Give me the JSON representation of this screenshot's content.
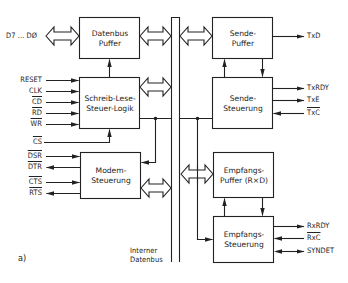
{
  "figure_label": "a)",
  "bus": {
    "label_line1": "Interner",
    "label_line2": "Datenbus"
  },
  "blocks": {
    "datenbus_puffer": {
      "line1": "Datenbus",
      "line2": "Puffer"
    },
    "schreib_lese": {
      "line1": "Schreib-Lese-",
      "line2": "Steuer-Logik"
    },
    "modem": {
      "line1": "Modem-",
      "line2": "Steuerung"
    },
    "sende_puffer": {
      "line1": "Sende-",
      "line2": "Puffer"
    },
    "sende_steuerung": {
      "line1": "Sende-",
      "line2": "Steuerung"
    },
    "empfangs_puffer": {
      "line1": "Empfangs-",
      "line2": "Puffer (R×D)"
    },
    "empfangs_steuerung": {
      "line1": "Empfangs-",
      "line2": "Steuerung"
    }
  },
  "signals_left": {
    "data": "D7 ... DØ",
    "reset": "RESET",
    "clk": "CLK",
    "cd": "C̅D̅",
    "cd_plain": "CD",
    "rd": "RD",
    "wr": "WR",
    "cs": "CS",
    "dsr": "DSR",
    "dtr": "DTR",
    "cts": "CTS",
    "rts": "RTS"
  },
  "signals_right": {
    "txd": "TxD",
    "txrdy": "TxRDY",
    "txe": "TxE",
    "txc": "TxC",
    "rxrdy": "RxRDY",
    "rxc": "RxC",
    "syndet": "SYNDET"
  },
  "colors": {
    "line": "#222222",
    "background": "#ffffff"
  }
}
